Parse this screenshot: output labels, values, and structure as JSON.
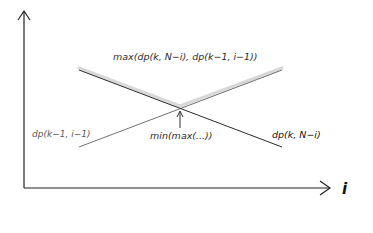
{
  "diagram": {
    "axes": {
      "x_label": "i",
      "origin": [
        24,
        188
      ],
      "x_end": [
        330,
        188
      ],
      "y_end": [
        24,
        10
      ]
    },
    "curves": {
      "descending": {
        "label": "dp(k, N−i)",
        "from": [
          79,
          70
        ],
        "to": [
          282,
          147
        ],
        "color": "#2b2b2b"
      },
      "ascending": {
        "label": "dp(k−1, i−1)",
        "from": [
          79,
          147
        ],
        "to": [
          282,
          70
        ],
        "color": "#6a6a6a"
      },
      "max_envelope": {
        "label": "max(dp(k, N−i), dp(k−1, i−1))",
        "color": "#d6d6d6"
      }
    },
    "intersection": {
      "label": "min(max(...))",
      "point": [
        180,
        108
      ]
    },
    "colors": {
      "axis": "#222222",
      "background": "#ffffff"
    }
  }
}
